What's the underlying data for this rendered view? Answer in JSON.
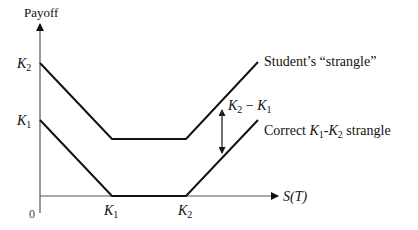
{
  "diagram": {
    "y_axis_label": "Payoff",
    "x_axis_label": "S(T)",
    "origin_label": "0",
    "y_ticks": [
      {
        "label": "K",
        "sub": "2",
        "y": 63
      },
      {
        "label": "K",
        "sub": "1",
        "y": 120
      }
    ],
    "x_ticks": [
      {
        "label": "K",
        "sub": "1",
        "x": 112
      },
      {
        "label": "K",
        "sub": "2",
        "x": 186
      }
    ],
    "series": [
      {
        "name": "Student's “strangle”",
        "label": "Student’s “strangle”",
        "points": [
          [
            40,
            63
          ],
          [
            112,
            139
          ],
          [
            186,
            139
          ],
          [
            258,
            62
          ]
        ]
      },
      {
        "name": "Correct K1-K2 strangle",
        "label_parts": [
          "Correct ",
          "K",
          "1",
          "-",
          "K",
          "2",
          " strangle"
        ],
        "points": [
          [
            40,
            120
          ],
          [
            112,
            196
          ],
          [
            186,
            196
          ],
          [
            258,
            120
          ]
        ]
      }
    ],
    "gap_annotation": {
      "text_parts": [
        "K",
        "2",
        " − ",
        "K",
        "1"
      ]
    },
    "colors": {
      "line": "#111111",
      "axis": "#444444",
      "text": "#111111"
    }
  }
}
